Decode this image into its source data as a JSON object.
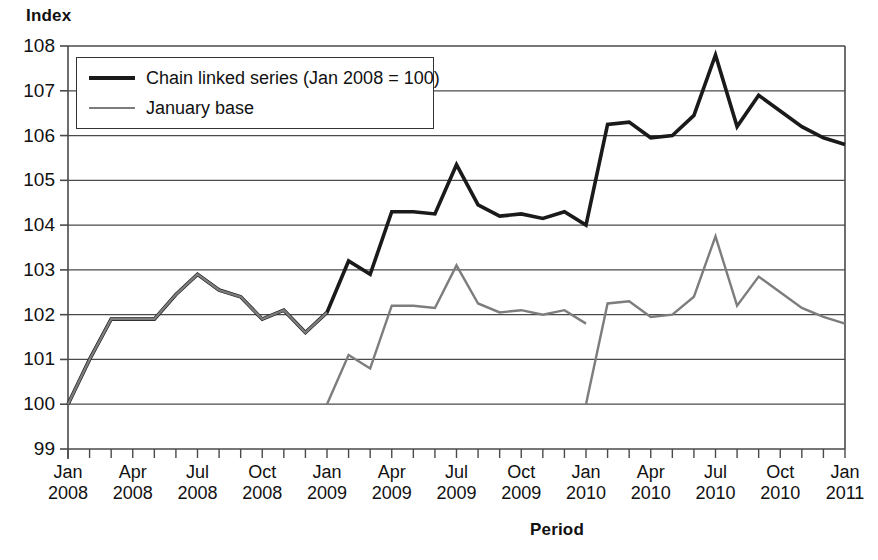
{
  "chart_data": {
    "type": "line",
    "title": "",
    "ylabel": "Index",
    "xlabel": "Period",
    "ylim": [
      99,
      108
    ],
    "yticks": [
      99,
      100,
      101,
      102,
      103,
      104,
      105,
      106,
      107,
      108
    ],
    "grid": true,
    "legend_position": "top-left",
    "x": [
      "Jan 2008",
      "Feb 2008",
      "Mar 2008",
      "Apr 2008",
      "May 2008",
      "Jun 2008",
      "Jul 2008",
      "Aug 2008",
      "Sep 2008",
      "Oct 2008",
      "Nov 2008",
      "Dec 2008",
      "Jan 2009",
      "Feb 2009",
      "Mar 2009",
      "Apr 2009",
      "May 2009",
      "Jun 2009",
      "Jul 2009",
      "Aug 2009",
      "Sep 2009",
      "Oct 2009",
      "Nov 2009",
      "Dec 2009",
      "Jan 2010",
      "Feb 2010",
      "Mar 2010",
      "Apr 2010",
      "May 2010",
      "Jun 2010",
      "Jul 2010",
      "Aug 2010",
      "Sep 2010",
      "Oct 2010",
      "Nov 2010",
      "Dec 2010",
      "Jan 2011"
    ],
    "xtick_labels": [
      {
        "month": "Jan",
        "year": "2008"
      },
      {
        "month": "Apr",
        "year": "2008"
      },
      {
        "month": "Jul",
        "year": "2008"
      },
      {
        "month": "Oct",
        "year": "2008"
      },
      {
        "month": "Jan",
        "year": "2009"
      },
      {
        "month": "Apr",
        "year": "2009"
      },
      {
        "month": "Jul",
        "year": "2009"
      },
      {
        "month": "Oct",
        "year": "2009"
      },
      {
        "month": "Jan",
        "year": "2010"
      },
      {
        "month": "Apr",
        "year": "2010"
      },
      {
        "month": "Jul",
        "year": "2010"
      },
      {
        "month": "Oct",
        "year": "2010"
      },
      {
        "month": "Jan",
        "year": "2011"
      }
    ],
    "series": [
      {
        "name": "Chain linked series (Jan 2008 = 100)",
        "color": "#1a1a1a",
        "width": 3.6,
        "segments": [
          {
            "start_index": 0,
            "values": [
              100.0,
              101.0,
              101.9,
              101.9,
              101.9,
              102.45,
              102.9,
              102.55,
              102.4,
              101.9,
              102.1,
              101.6,
              102.05,
              103.2,
              102.9,
              104.3,
              104.3,
              104.25,
              105.35,
              104.45,
              104.2,
              104.25,
              104.15,
              104.3,
              104.0,
              106.25,
              106.3,
              105.95,
              106.0,
              106.45,
              107.8,
              106.2,
              106.9,
              106.55,
              106.2,
              105.95,
              105.8
            ]
          }
        ]
      },
      {
        "name": "January base",
        "color": "#7d7d7d",
        "width": 2.4,
        "segments": [
          {
            "start_index": 0,
            "values": [
              100.0,
              101.0,
              101.9,
              101.9,
              101.9,
              102.45,
              102.9,
              102.55,
              102.4,
              101.9,
              102.1,
              101.6,
              102.05
            ]
          },
          {
            "start_index": 12,
            "values": [
              100.0,
              101.1,
              100.8,
              102.2,
              102.2,
              102.15,
              103.1,
              102.25,
              102.05,
              102.1,
              102.0,
              102.1,
              101.8
            ]
          },
          {
            "start_index": 24,
            "values": [
              100.0,
              102.25,
              102.3,
              101.95,
              102.0,
              102.4,
              103.75,
              102.2,
              102.85,
              102.5,
              102.15,
              101.95,
              101.8
            ]
          }
        ]
      }
    ]
  },
  "legend": {
    "items": [
      {
        "label": "Chain linked series (Jan 2008 = 100)",
        "style": "sw-dark"
      },
      {
        "label": "January base",
        "style": "sw-gray"
      }
    ]
  }
}
